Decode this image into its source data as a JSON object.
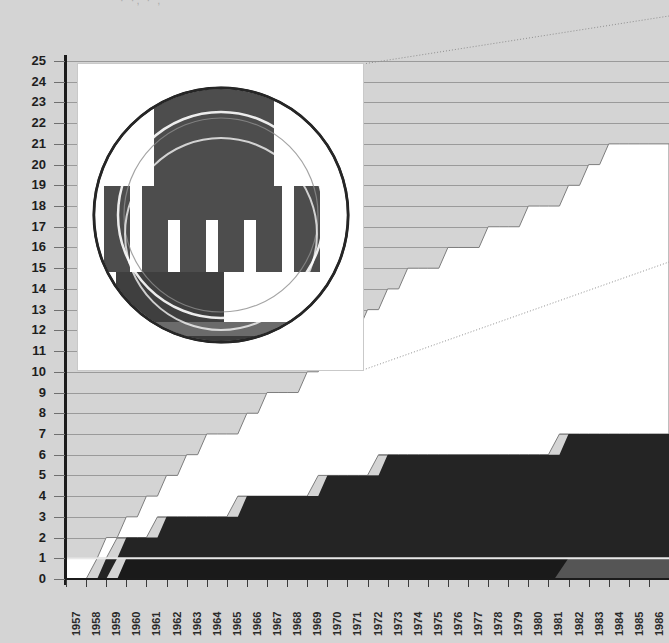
{
  "page": {
    "background_color": "#d4d4d4",
    "top_text_fragment": "· ·,  ·  ,"
  },
  "inset": {
    "name": "institution-logo",
    "description": "circular emblem with vertical columns",
    "background_color": "#ffffff",
    "logo_colors": [
      "#4a4a4a",
      "#5c5c5c",
      "#2e2e2e",
      "#ffffff"
    ],
    "leader_line_style": "dotted"
  },
  "chart_data": {
    "type": "area",
    "title": "",
    "subtitle": "",
    "xlabel": "",
    "ylabel": "",
    "xlim": [
      1957,
      1987
    ],
    "ylim": [
      0,
      25
    ],
    "grid": true,
    "legend_position": "none",
    "stacked": true,
    "x": [
      1957,
      1958,
      1959,
      1960,
      1961,
      1962,
      1963,
      1964,
      1965,
      1966,
      1967,
      1968,
      1969,
      1970,
      1971,
      1972,
      1973,
      1974,
      1975,
      1976,
      1977,
      1978,
      1979,
      1980,
      1981,
      1982,
      1983,
      1984,
      1985,
      1986,
      1987
    ],
    "tick_labels_x": [
      "1957",
      "1958",
      "1959",
      "1960",
      "1961",
      "1962",
      "1963",
      "1964",
      "1965",
      "1966",
      "1967",
      "1968",
      "1969",
      "1970",
      "1971",
      "1972",
      "1973",
      "1974",
      "1975",
      "1976",
      "1977",
      "1978",
      "1979",
      "1980",
      "1981",
      "1982",
      "1983",
      "1984",
      "1985",
      "1986",
      "1987"
    ],
    "tick_labels_y": [
      "0",
      "1",
      "2",
      "3",
      "4",
      "5",
      "6",
      "7",
      "8",
      "9",
      "10",
      "11",
      "12",
      "13",
      "14",
      "15",
      "16",
      "17",
      "18",
      "19",
      "20",
      "21",
      "22",
      "23",
      "24",
      "25"
    ],
    "series": [
      {
        "name": "band-lowest",
        "color": "#1a1a1a",
        "values": [
          0,
          0,
          0,
          1,
          1,
          1,
          1,
          1,
          1,
          1,
          1,
          1,
          1,
          1,
          1,
          1,
          1,
          1,
          1,
          1,
          1,
          1,
          1,
          1,
          1,
          1,
          1,
          1,
          1,
          1,
          1
        ]
      },
      {
        "name": "band-gray-overlay",
        "color": "#555555",
        "note": "gray segment replacing lowest band from 1981 onward",
        "values": [
          0,
          0,
          0,
          0,
          0,
          0,
          0,
          0,
          0,
          0,
          0,
          0,
          0,
          0,
          0,
          0,
          0,
          0,
          0,
          0,
          0,
          0,
          0,
          0,
          1,
          1,
          1,
          1,
          1,
          1,
          1
        ]
      },
      {
        "name": "band-dark",
        "color": "#242424",
        "values": [
          0,
          0,
          1,
          1,
          1,
          2,
          2,
          2,
          2,
          3,
          3,
          3,
          3,
          4,
          4,
          4,
          5,
          5,
          5,
          5,
          5,
          5,
          5,
          5,
          5,
          6,
          6,
          6,
          6,
          6,
          6
        ]
      },
      {
        "name": "band-white",
        "color": "#ffffff",
        "values": [
          1,
          1,
          1,
          1,
          2,
          2,
          3,
          4,
          4,
          4,
          5,
          5,
          6,
          6,
          7,
          8,
          8,
          9,
          9,
          10,
          10,
          11,
          11,
          12,
          12,
          12,
          13,
          14,
          14,
          14,
          14
        ]
      }
    ],
    "totals": [
      1,
      1,
      2,
      3,
      4,
      5,
      6,
      7,
      7,
      8,
      9,
      9,
      10,
      11,
      12,
      13,
      14,
      15,
      15,
      16,
      16,
      17,
      17,
      18,
      18,
      19,
      20,
      21,
      21,
      21,
      21
    ]
  }
}
